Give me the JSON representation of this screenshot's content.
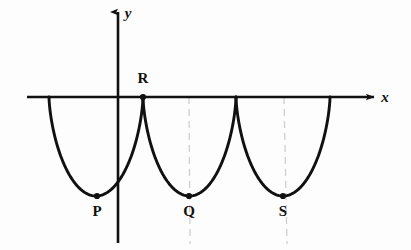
{
  "figure": {
    "type": "math-graph",
    "background_color": "#fdfdfd",
    "curve_color": "#111111",
    "axis_color": "#111111",
    "guide_color": "#cfcfcf"
  },
  "axes": {
    "x_axis": {
      "label": "x",
      "label_x": 385,
      "label_y": 102,
      "y": 97,
      "x_start": 27,
      "x_end": 374,
      "arrow": "right"
    },
    "y_axis": {
      "label": "y",
      "label_x": 128,
      "label_y": 18,
      "x": 118,
      "y_start": 243,
      "y_end": 10,
      "arrow": "up"
    }
  },
  "points": [
    {
      "id": "P",
      "label": "P",
      "x": 97,
      "y": 196,
      "label_x": 97,
      "label_y": 216,
      "kind": "minimum"
    },
    {
      "id": "R",
      "label": "R",
      "x": 143,
      "y": 97,
      "label_x": 143,
      "label_y": 83,
      "kind": "cusp"
    },
    {
      "id": "Q",
      "label": "Q",
      "x": 189,
      "y": 196,
      "label_x": 189,
      "label_y": 216,
      "kind": "minimum"
    },
    {
      "id": "S",
      "label": "S",
      "x": 283,
      "y": 196,
      "label_x": 283,
      "label_y": 216,
      "kind": "minimum"
    }
  ],
  "arches": [
    {
      "id": "arch-1",
      "start_x": 49,
      "end_x": 143,
      "min_x": 97,
      "min_y": 196
    },
    {
      "id": "arch-2",
      "start_x": 143,
      "end_x": 236,
      "min_x": 189,
      "min_y": 196
    },
    {
      "id": "arch-3",
      "start_x": 236,
      "end_x": 330,
      "min_x": 283,
      "min_y": 196
    }
  ],
  "guide_lines": [
    {
      "id": "guide-q",
      "x": 189,
      "y_top": 97,
      "y_bottom": 244
    },
    {
      "id": "guide-s",
      "x": 284,
      "y_top": 97,
      "y_bottom": 244
    }
  ],
  "chart_data": {
    "type": "line",
    "title": "",
    "xlabel": "x",
    "ylabel": "y",
    "grid": false,
    "legend": null,
    "curve_name": "inverted cycloid arches",
    "cusps_on_axis_px": [
      49,
      143,
      236,
      330
    ],
    "minima_px": [
      {
        "label": "P",
        "x": 97,
        "y": 196
      },
      {
        "label": "Q",
        "x": 189,
        "y": 196
      },
      {
        "label": "S",
        "x": 283,
        "y": 196
      }
    ],
    "labelled_points": [
      "P",
      "R",
      "Q",
      "S"
    ],
    "arch_width_px": 94,
    "arch_depth_px": 99,
    "axis_origin_px": {
      "x": 118,
      "y": 97
    },
    "annotations": [
      "R lies on the x-axis at a cusp between the first and second arch",
      "P, Q and S are the lowest points of the three arches"
    ]
  }
}
